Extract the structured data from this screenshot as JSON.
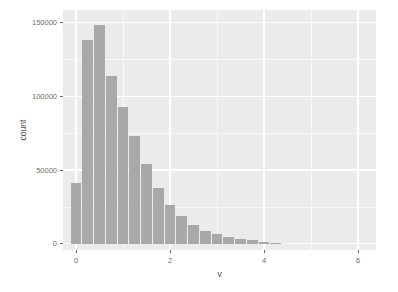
{
  "figure": {
    "width_px": 398,
    "height_px": 292,
    "background": "#ffffff"
  },
  "chart_data": {
    "type": "bar",
    "subtype": "histogram",
    "title": "",
    "xlabel": "v",
    "ylabel": "count",
    "binwidth": 0.25,
    "bin_centers": [
      0,
      0.25,
      0.5,
      0.75,
      1.0,
      1.25,
      1.5,
      1.75,
      2.0,
      2.25,
      2.5,
      2.75,
      3.0,
      3.25,
      3.5,
      3.75,
      4.0,
      4.25
    ],
    "counts": [
      41000,
      138500,
      148500,
      113500,
      92500,
      73000,
      54000,
      38000,
      26500,
      18500,
      12500,
      8500,
      6300,
      4600,
      3400,
      2400,
      1400,
      500
    ],
    "x_ticks": {
      "values": [
        0,
        2,
        4,
        6
      ],
      "labels": [
        "0",
        "2",
        "4",
        "6"
      ]
    },
    "y_ticks": {
      "values": [
        0,
        50000,
        100000,
        150000
      ],
      "labels": [
        "0",
        "50000",
        "100000",
        "150000"
      ]
    },
    "x_minor_gridlines": [
      1,
      3,
      5
    ],
    "y_minor_gridlines": [
      25000,
      75000,
      125000
    ],
    "xlim": [
      -0.28,
      6.38
    ],
    "ylim": [
      -4300,
      158500
    ],
    "grid": true,
    "legend": false,
    "style": {
      "panel_background": "#ebebeb",
      "bar_fill": "#a8a8a8",
      "gridline_color": "#ffffff",
      "tick_color": "#666666",
      "tick_label_color": "#6e6e6e",
      "axis_title_color": "#4d4d4d"
    }
  }
}
